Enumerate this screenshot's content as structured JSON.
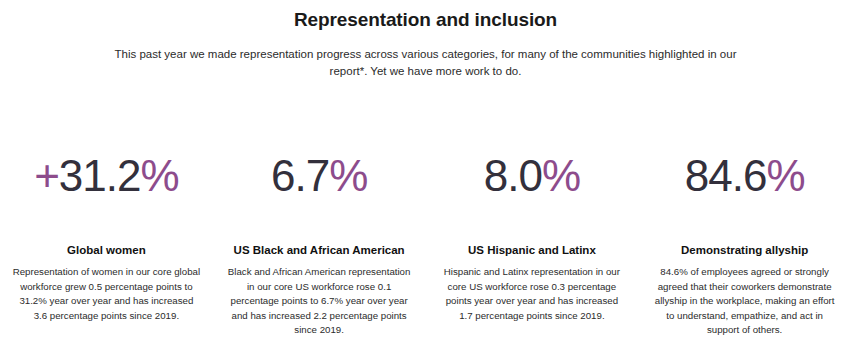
{
  "header": {
    "title": "Representation and inclusion",
    "subtitle": "This past year we made representation progress across various categories, for many of the communities highlighted in our report*. Yet we have more work to do."
  },
  "colors": {
    "accent_purple": "#8d4c8c",
    "value_dark": "#33303c",
    "text": "#2b2b2b",
    "background": "#ffffff"
  },
  "stats": [
    {
      "value_prefix": "+",
      "value_number": "31.2",
      "value_suffix": "%",
      "value_full": "+31.2%",
      "label": "Global women",
      "description": "Representation of women in our core global workforce grew 0.5 percentage points to 31.2% year over year and has increased 3.6 percentage points since 2019."
    },
    {
      "value_prefix": "",
      "value_number": "6.7",
      "value_suffix": "%",
      "value_full": "6.7%",
      "label": "US Black and African American",
      "description": "Black and African American representation in our core US workforce rose 0.1 percentage points to 6.7% year over year and has increased 2.2 percentage points since 2019."
    },
    {
      "value_prefix": "",
      "value_number": "8.0",
      "value_suffix": "%",
      "value_full": "8.0%",
      "label": "US Hispanic and Latinx",
      "description": "Hispanic and Latinx representation in our core US workforce rose 0.3 percentage points year over year and has increased 1.7 percentage points since 2019."
    },
    {
      "value_prefix": "",
      "value_number": "84.6",
      "value_suffix": "%",
      "value_full": "84.6%",
      "label": "Demonstrating allyship",
      "description": "84.6% of employees agreed or strongly agreed that their coworkers demonstrate allyship in the workplace, making an effort to understand, empathize, and act in support of others."
    }
  ]
}
